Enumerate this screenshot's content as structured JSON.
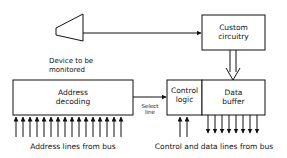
{
  "diagram": {
    "device_label_line1": "Device to be",
    "device_label_line2": "monitored",
    "custom_box_line1": "Custom",
    "custom_box_line2": "circuitry",
    "address_box_line1": "Address",
    "address_box_line2": "decoding",
    "select_line_line1": "Select",
    "select_line_line2": "line",
    "control_box_line1": "Control",
    "control_box_line2": "logic",
    "data_box_line1": "Data",
    "data_box_line2": "buffer",
    "address_bus_label": "Address lines from bus",
    "control_data_bus_label": "Control and data lines from bus",
    "address_line_count": 16,
    "control_line_count": 2,
    "data_line_count": 8
  }
}
